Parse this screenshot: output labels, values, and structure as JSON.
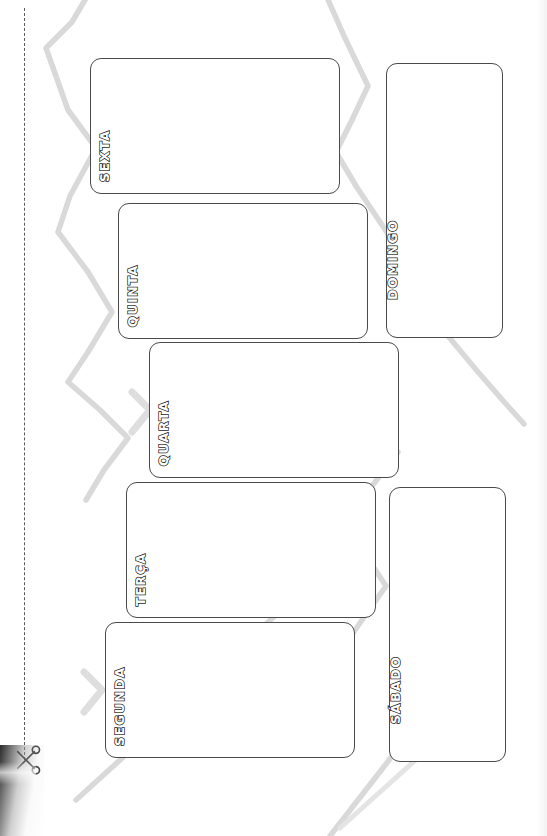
{
  "document": {
    "type": "weekly-planner-worksheet",
    "language": "pt-BR",
    "title": "MINHA SEMANA:",
    "orientation_note": "rotated-90-ccw"
  },
  "icons": {
    "scissors": "scissors-icon",
    "cut_line": "dashed-cut-line"
  },
  "colors": {
    "ink": "#1d1d1d",
    "card_border": "#4a4a4a",
    "decor_gray": "#d9d9d9",
    "paper": "#ffffff"
  },
  "days": [
    {
      "id": "segunda",
      "label": "SEGUNDA",
      "placeholder": "",
      "value": "",
      "rect": {
        "x": 105,
        "y": 622,
        "w": 250,
        "h": 136
      }
    },
    {
      "id": "terca",
      "label": "TERÇA",
      "placeholder": "",
      "value": "",
      "rect": {
        "x": 126,
        "y": 482,
        "w": 250,
        "h": 136
      }
    },
    {
      "id": "quarta",
      "label": "QUARTA",
      "placeholder": "",
      "value": "",
      "rect": {
        "x": 149,
        "y": 342,
        "w": 250,
        "h": 136
      }
    },
    {
      "id": "quinta",
      "label": "QUINTA",
      "placeholder": "",
      "value": "",
      "rect": {
        "x": 118,
        "y": 203,
        "w": 250,
        "h": 136
      }
    },
    {
      "id": "sexta",
      "label": "SEXTA",
      "placeholder": "",
      "value": "",
      "rect": {
        "x": 90,
        "y": 58,
        "w": 250,
        "h": 136
      }
    },
    {
      "id": "sabado",
      "label": "SÁBADO",
      "placeholder": "",
      "value": "",
      "rect": {
        "x": 389,
        "y": 487,
        "w": 117,
        "h": 275
      }
    },
    {
      "id": "domingo",
      "label": "DOMINGO",
      "placeholder": "",
      "value": "",
      "rect": {
        "x": 386,
        "y": 63,
        "w": 117,
        "h": 275
      }
    }
  ]
}
